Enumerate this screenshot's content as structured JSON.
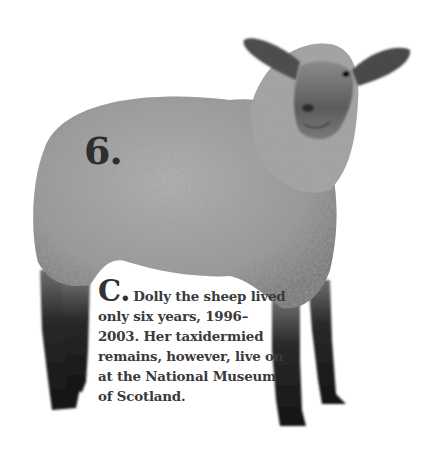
{
  "article": {
    "item_number": "6.",
    "answer_letter": "C.",
    "answer_text": "Dolly the sheep lived only six years, 1996–2003. Her taxidermied remains, however, live on at the National Museum of Scotland."
  },
  "image": {
    "subject": "sheep-photo",
    "style": "black-and-white"
  },
  "colors": {
    "background": "#ffffff",
    "text": "#3a3a3a",
    "wool": "#9a9a9a",
    "legs": "#1e1e1e"
  }
}
